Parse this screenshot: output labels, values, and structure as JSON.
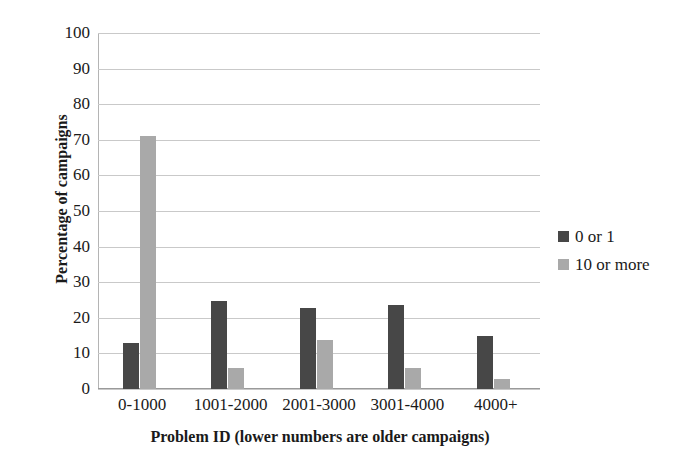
{
  "chart_data": {
    "type": "bar",
    "title": "",
    "subtitle": "",
    "xlabel": "Problem ID (lower numbers are older campaigns)",
    "ylabel": "Percentage of campaigns",
    "categories": [
      "0-1000",
      "1001-2000",
      "2001-3000",
      "3001-4000",
      "4000+"
    ],
    "series": [
      {
        "name": "0 or 1",
        "color": "#474747",
        "values": [
          13.0,
          24.8,
          22.7,
          23.5,
          14.8
        ]
      },
      {
        "name": "10 or more",
        "color": "#a9a9a9",
        "values": [
          71.0,
          5.9,
          13.8,
          5.8,
          2.7
        ]
      }
    ],
    "ylim": [
      0,
      100
    ],
    "ytick_step": 10,
    "yticks": [
      "100",
      "90",
      "80",
      "70",
      "60",
      "50",
      "40",
      "30",
      "20",
      "10",
      "0"
    ],
    "grid": true,
    "grid_axis": "y",
    "legend_position": "right",
    "legend": [
      {
        "label": "0 or 1",
        "color": "#474747",
        "swatch": "square-swatch"
      },
      {
        "label": "10 or more",
        "color": "#a9a9a9",
        "swatch": "square-swatch"
      }
    ],
    "colors": {
      "background": "#ffffff",
      "gridline": "#c9c9c9",
      "axis": "#9a9a9a",
      "text": "#1a1a1a"
    }
  }
}
